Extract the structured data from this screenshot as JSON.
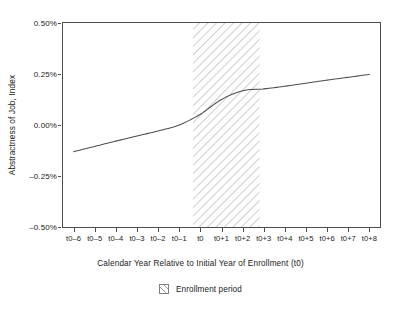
{
  "chart_data": {
    "type": "line",
    "title": "",
    "xlabel": "Calendar Year Relative to Initial Year of Enrollment (t0)",
    "ylabel": "Abstractness of Job, Index",
    "x_tick_labels": [
      "t0–6",
      "t0–5",
      "t0–4",
      "t0–3",
      "t0–2",
      "t0–1",
      "t0",
      "t0+1",
      "t0+2",
      "t0+3",
      "t0+4",
      "t0+5",
      "t0+6",
      "t0+7",
      "t0+8"
    ],
    "x": [
      -6,
      -5,
      -4,
      -3,
      -2,
      -1,
      0,
      1,
      2,
      3,
      4,
      5,
      6,
      7,
      8
    ],
    "y_tick_labels": [
      "0.50%",
      "0.25%",
      "0.00%",
      "–0.25%",
      "–0.50%"
    ],
    "y_tick_values": [
      0.5,
      0.25,
      0.0,
      -0.25,
      -0.5
    ],
    "ylim": [
      -0.5,
      0.5
    ],
    "xlim": [
      -6.5,
      8.5
    ],
    "grid": false,
    "legend_position": "below-axis-center",
    "series": [
      {
        "name": "Abstractness of Job, Index",
        "color": "#4d4d4d",
        "values": [
          -0.131,
          -0.105,
          -0.079,
          -0.054,
          -0.029,
          0.0,
          0.053,
          0.125,
          0.168,
          0.177,
          0.19,
          0.205,
          0.22,
          0.234,
          0.248
        ]
      }
    ],
    "shaded_regions": [
      {
        "label": "Enrollment period",
        "x_start": -0.35,
        "x_end": 2.8,
        "pattern": "diagonal-hatch",
        "color": "#9a9a9a"
      }
    ],
    "legend": [
      {
        "label": "Enrollment period",
        "swatch": "hatch-swatch"
      }
    ]
  }
}
